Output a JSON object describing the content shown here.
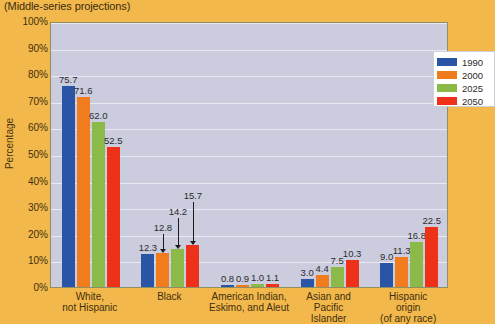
{
  "chart_data": {
    "type": "bar",
    "title": "(Middle-series projections)",
    "xlabel": "",
    "ylabel": "Percentage",
    "ylim": [
      0,
      100
    ],
    "ytick_labels": [
      "100%",
      "90%",
      "80%",
      "70%",
      "60%",
      "50%",
      "40%",
      "30%",
      "20%",
      "10%",
      "0%"
    ],
    "ytick_values": [
      100,
      90,
      80,
      70,
      60,
      50,
      40,
      30,
      20,
      10,
      0
    ],
    "grid": true,
    "legend_position": "top-right",
    "categories": [
      "White,\nnot Hispanic",
      "Black",
      "American Indian,\nEskimo, and Aleut",
      "Asian and\nPacific\nIslander",
      "Hispanic\norigin\n(of any race)"
    ],
    "series": [
      {
        "name": "1990",
        "color": "#2a54a6",
        "values": [
          75.7,
          12.3,
          0.8,
          3.0,
          9.0
        ]
      },
      {
        "name": "2000",
        "color": "#f07c1e",
        "values": [
          71.6,
          12.8,
          0.9,
          4.4,
          11.3
        ]
      },
      {
        "name": "2025",
        "color": "#8cba48",
        "values": [
          62.0,
          14.2,
          1.0,
          7.5,
          16.8
        ]
      },
      {
        "name": "2050",
        "color": "#ee3119",
        "values": [
          52.5,
          15.7,
          1.1,
          10.3,
          22.5
        ]
      }
    ],
    "annotations": [
      {
        "label": "12.8",
        "series": "2000",
        "category": "Black",
        "arrow": true
      },
      {
        "label": "14.2",
        "series": "2025",
        "category": "Black",
        "arrow": true
      },
      {
        "label": "15.7",
        "series": "2050",
        "category": "Black",
        "arrow": true
      }
    ],
    "colors": {
      "page_background": "#f2b84b",
      "plot_background": "#ccccdf",
      "gridline": "#e9e9f2",
      "plot_border": "#8f8f66",
      "legend_background": "#ffffff",
      "text": "#42300f"
    }
  }
}
